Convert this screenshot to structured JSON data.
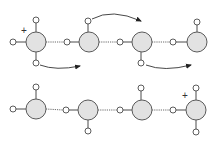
{
  "diagram": {
    "colors": {
      "oxygen_fill": "#e2e2e2",
      "stroke": "#5a5a5a",
      "arrow": "#333333"
    },
    "top_row": {
      "label": "before",
      "charge_symbol": "+",
      "oxygens": [
        {
          "cx": 36,
          "cy": 42,
          "hydrogens": [
            [
              36,
              20
            ],
            [
              13,
              42
            ],
            [
              36,
              63
            ]
          ]
        },
        {
          "cx": 89,
          "cy": 42,
          "hydrogens": [
            [
              88,
              21
            ],
            [
              67,
              42
            ]
          ]
        },
        {
          "cx": 142,
          "cy": 42,
          "hydrogens": [
            [
              120,
              42
            ],
            [
              141,
              63
            ]
          ]
        },
        {
          "cx": 197,
          "cy": 42,
          "hydrogens": [
            [
              173,
              42
            ],
            [
              197,
              22
            ]
          ]
        }
      ],
      "arrows": [
        "arrow-1",
        "arrow-2",
        "arrow-3"
      ]
    },
    "bottom_row": {
      "label": "after",
      "charge_symbol": "+",
      "oxygens": [
        {
          "cx": 36,
          "cy": 109,
          "hydrogens": [
            [
              36,
              87
            ],
            [
              13,
              109
            ]
          ]
        },
        {
          "cx": 88,
          "cy": 110,
          "hydrogens": [
            [
              66,
              110
            ],
            [
              88,
              131
            ]
          ]
        },
        {
          "cx": 142,
          "cy": 110,
          "hydrogens": [
            [
              141,
              88
            ],
            [
              120,
              110
            ]
          ]
        },
        {
          "cx": 196,
          "cy": 110,
          "hydrogens": [
            [
              173,
              110
            ],
            [
              196,
              88
            ],
            [
              196,
              132
            ]
          ]
        }
      ]
    }
  }
}
